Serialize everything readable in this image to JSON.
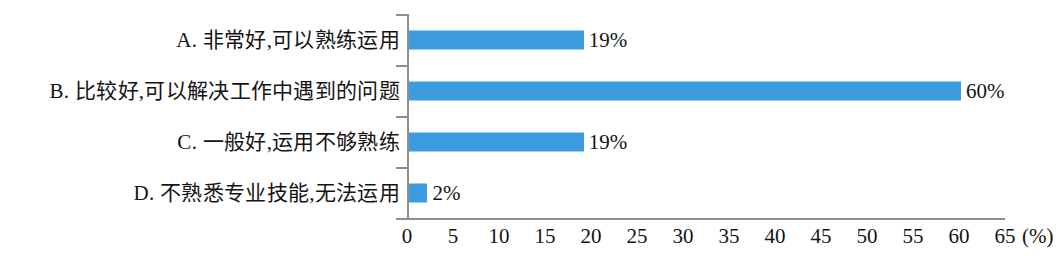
{
  "chart_data": {
    "type": "bar",
    "orientation": "horizontal",
    "title": "",
    "subtitle": "",
    "xlabel": "(%)",
    "ylabel": "",
    "categories": [
      "A. 非常好,可以熟练运用",
      "B. 比较好,可以解决工作中遇到的问题",
      "C. 一般好,运用不够熟练",
      "D. 不熟悉专业技能,无法运用"
    ],
    "values": [
      19,
      60,
      19,
      2
    ],
    "value_labels": [
      "19%",
      "60%",
      "19%",
      "2%"
    ],
    "xlim": [
      0,
      65
    ],
    "x_ticks": [
      0,
      5,
      10,
      15,
      20,
      25,
      30,
      35,
      40,
      45,
      50,
      55,
      60,
      65
    ],
    "x_tick_labels": [
      "0",
      "5",
      "10",
      "15",
      "20",
      "25",
      "30",
      "35",
      "40",
      "45",
      "50",
      "55",
      "60",
      "65"
    ],
    "unit_label": "(%)",
    "grid": false,
    "legend": false,
    "bar_color": "#3d9ce0",
    "axis_color": "#8d8d8d"
  }
}
